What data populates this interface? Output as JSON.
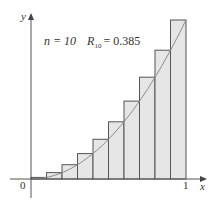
{
  "chart_data": {
    "type": "bar",
    "subtype": "riemann-sum-right-endpoints",
    "function": "y = x^2",
    "n": 10,
    "annotation": {
      "n_label": "n = 10",
      "sum_label": "R",
      "sum_subscript": "10",
      "sum_value": "= 0.385"
    },
    "categories": [
      "0.0-0.1",
      "0.1-0.2",
      "0.2-0.3",
      "0.3-0.4",
      "0.4-0.5",
      "0.5-0.6",
      "0.6-0.7",
      "0.7-0.8",
      "0.8-0.9",
      "0.9-1.0"
    ],
    "values": [
      0.01,
      0.04,
      0.09,
      0.16,
      0.25,
      0.36,
      0.49,
      0.64,
      0.81,
      1.0
    ],
    "xlabel": "x",
    "ylabel": "y",
    "x_ticks": [
      "0",
      "1"
    ],
    "xlim": [
      0,
      1
    ],
    "ylim": [
      0,
      1
    ],
    "grid": false,
    "colors": {
      "bar_fill": "#e6e6e6",
      "bar_stroke": "#555555",
      "curve": "#888888",
      "axis": "#555555"
    }
  },
  "labels": {
    "origin": "0",
    "x_tick_one": "1",
    "x_axis": "x",
    "y_axis": "y",
    "n_text": "n = 10",
    "R": "R",
    "R_sub": "10",
    "R_value": "= 0.385"
  }
}
